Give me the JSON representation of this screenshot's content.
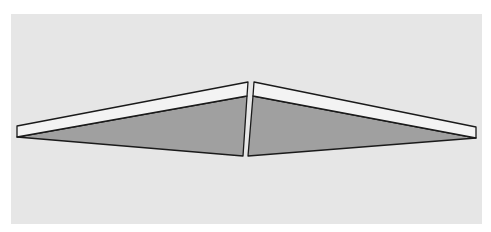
{
  "figure": {
    "colors": {
      "panel": "#e6e6e6",
      "top_strip": "#f3f3f3",
      "body": "#a0a0a0",
      "outline": "#1a1a1a"
    },
    "left_wedge": {
      "top_strip_points": "17,126 248,82 247,96 17,137",
      "body_points": "17,137 247,96 243,156"
    },
    "right_wedge": {
      "top_strip_points": "254,82 476,127 476,138 253,96",
      "body_points": "253,96 476,138 248,156"
    }
  }
}
